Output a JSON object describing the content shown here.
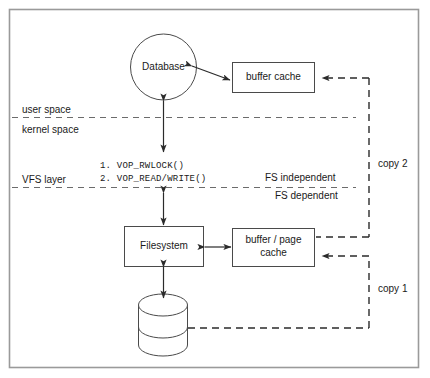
{
  "figure": {
    "frame": {
      "color": "#9a9a9a"
    },
    "line_color": "#3a3a3a",
    "dash_color": "#2b2b2b"
  },
  "nodes": {
    "database": {
      "label": "Database",
      "shape": "circle"
    },
    "buffer_cache": {
      "label": "buffer cache",
      "shape": "rect"
    },
    "filesystem": {
      "label": "Filesystem",
      "shape": "rect"
    },
    "buffer_page_cache": {
      "label_line1": "buffer / page",
      "label_line2": "cache",
      "shape": "rect"
    },
    "disk": {
      "label": "",
      "shape": "cylinder"
    }
  },
  "boundaries": {
    "user_space": "user space",
    "kernel_space": "kernel space",
    "fs_independent": "FS independent",
    "fs_dependent": "FS dependent"
  },
  "layers": {
    "vfs_layer": "VFS layer"
  },
  "vops": [
    "1. VOP_RWLOCK()",
    "2. VOP_READ/WRITE()"
  ],
  "copies": {
    "copy1": "copy 1",
    "copy2": "copy 2"
  }
}
